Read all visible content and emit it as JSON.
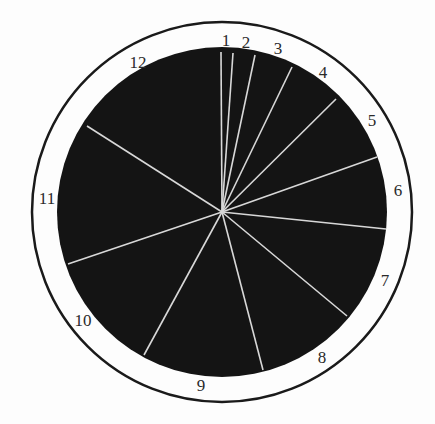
{
  "chart_data": {
    "type": "pie",
    "title": "",
    "center": [
      222,
      212
    ],
    "outer_ring_radius": 190,
    "disk_radius": 165,
    "colors": {
      "background": "#fdfdfd",
      "ring_stroke": "#1a1a1a",
      "disk_fill": "#141414",
      "divider": "#d8d8d8",
      "label": "#2a2a2a"
    },
    "categories": [
      "1",
      "2",
      "3",
      "4",
      "5",
      "6",
      "7",
      "8",
      "9",
      "10",
      "11",
      "12"
    ],
    "divider_endpoints": [
      [
        221,
        52
      ],
      [
        233,
        53
      ],
      [
        255,
        55
      ],
      [
        292,
        67
      ],
      [
        336,
        99
      ],
      [
        377,
        157
      ],
      [
        386,
        229
      ],
      [
        347,
        316
      ],
      [
        263,
        370
      ],
      [
        144,
        355
      ],
      [
        68,
        264
      ],
      [
        87,
        126
      ]
    ],
    "values_deg": [
      4.3,
      7.6,
      15.8,
      18.6,
      23.6,
      29.7,
      37.8,
      31.5,
      31.1,
      40.4,
      43.3,
      76.3
    ],
    "labels": [
      {
        "text": "1",
        "x": 226,
        "y": 46
      },
      {
        "text": "2",
        "x": 246,
        "y": 48
      },
      {
        "text": "3",
        "x": 278,
        "y": 54
      },
      {
        "text": "4",
        "x": 323,
        "y": 78
      },
      {
        "text": "5",
        "x": 372,
        "y": 126
      },
      {
        "text": "6",
        "x": 398,
        "y": 196
      },
      {
        "text": "7",
        "x": 385,
        "y": 286
      },
      {
        "text": "8",
        "x": 322,
        "y": 363
      },
      {
        "text": "9",
        "x": 201,
        "y": 391
      },
      {
        "text": "10",
        "x": 83,
        "y": 326
      },
      {
        "text": "11",
        "x": 47,
        "y": 204
      },
      {
        "text": "12",
        "x": 138,
        "y": 68
      }
    ],
    "legend": null,
    "grid": false
  }
}
